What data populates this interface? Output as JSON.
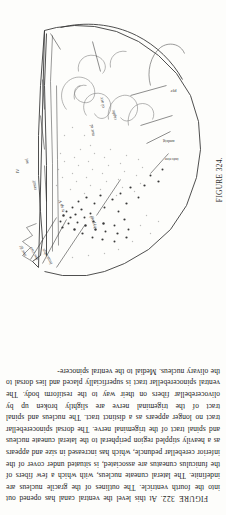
{
  "page": {
    "background_color": "#fdfdfb",
    "ink_color": "#1c1c1c"
  },
  "figure": {
    "plate_label": "FIGURE 324.",
    "description_alt": "Line drawing of a transverse section of the medulla oblongata at the level of the open fourth ventricle, with leader lines to labelled nuclei and tracts.",
    "labels": [
      {
        "id": "f-nuc-gr",
        "text": "nuc gr",
        "x": 30,
        "y": 28
      },
      {
        "id": "f-nuc-cun",
        "text": "nuc cun",
        "x": 30,
        "y": 40
      },
      {
        "id": "f-funic",
        "text": "funiculus",
        "x": 28,
        "y": 54
      },
      {
        "id": "f-restif",
        "text": "restif",
        "x": 96,
        "y": 38
      },
      {
        "id": "f-sol",
        "text": "sol",
        "x": 120,
        "y": 30
      },
      {
        "id": "f-tr sp V",
        "text": "tr sp V",
        "x": 74,
        "y": 66
      },
      {
        "id": "f-nuc-ol",
        "text": "nuc ol",
        "x": 150,
        "y": 96
      },
      {
        "id": "f-ol-acc",
        "text": "ol acc",
        "x": 176,
        "y": 104
      },
      {
        "id": "f-ambig",
        "text": "ambig",
        "x": 146,
        "y": 142
      },
      {
        "id": "f-infer",
        "text": "inferior",
        "x": 126,
        "y": 150
      },
      {
        "id": "f-pyr",
        "text": "pyr",
        "x": 188,
        "y": 150
      },
      {
        "id": "f-raphe",
        "text": "raphe",
        "x": 166,
        "y": 118
      },
      {
        "id": "f-hypogl",
        "text": "hypogl",
        "x": 60,
        "y": 96
      },
      {
        "id": "f-IV",
        "text": "IV",
        "x": 112,
        "y": 18
      }
    ]
  },
  "caption": {
    "figure_number": "FIGURE 322.",
    "body": "At this level the ventral canal has opened out into the fourth ventricle. The outlines of the gracile nucleus are indefinite. The lateral cuneate nucleus, with which a few fibers of the funiculus cuneatus are associated, is situated under cover of the inferior cerebellar peduncle, which has increased in size and appears as a heavily stippled region peripheral to the lateral cuneate nucleus and spinal tract of the trigeminal nerve. The dorsal spinocerebellar tract no longer appears as a distinct tract. The nucleus and spinal tract of the trigeminal nerve are slightly broken up by olivocerebellar fibers on their way to the restiform body. The ventral spinocerebellar tract is superficially placed and lies dorsal to the olivary nucleus. Medial to the ventral spinocere-"
  }
}
